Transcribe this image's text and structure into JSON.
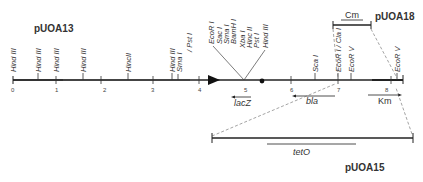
{
  "plasmids": {
    "main": "pUOA13",
    "top_right": "pUOA18",
    "bottom": "pUOA15"
  },
  "scale_ticks": [
    "0",
    "1",
    "2",
    "3",
    "4",
    "5",
    "6",
    "7",
    "8"
  ],
  "sites_left": [
    {
      "label": "Hind III"
    },
    {
      "label": "Hind III"
    },
    {
      "label": "Hind III"
    },
    {
      "label": "Hind III"
    },
    {
      "label": "HincII"
    },
    {
      "label": "Hind III"
    },
    {
      "label": "Sma I"
    },
    {
      "label": "/ Pst I"
    }
  ],
  "mcs_sites": [
    "EcoR I",
    "Sac I",
    "Sma I",
    "BamH I",
    "Xba I",
    "Hinc II",
    "Pst I",
    "Hind III"
  ],
  "sites_right": [
    {
      "label": "Sca I"
    },
    {
      "label": "EcoR I / Cla I"
    },
    {
      "label": "EcoR V"
    },
    {
      "label": "EcoR V"
    }
  ],
  "genes": {
    "lacZ": "lacZ",
    "bla": "bla",
    "Km": "Km",
    "Cm": "Cm",
    "tetO": "tetO"
  }
}
